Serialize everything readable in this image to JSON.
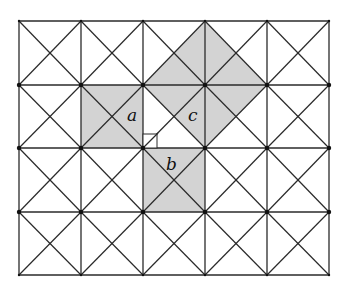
{
  "figure": {
    "grid": {
      "x": [
        19,
        81,
        143,
        205,
        267,
        329
      ],
      "y": [
        21,
        85,
        148,
        212,
        275
      ],
      "line_color": "#2a2a2a",
      "background": "#ffffff"
    },
    "shade_color": "#d3d3d3",
    "shaded_squares": [
      {
        "id": "square-a",
        "points": [
          [
            81,
            85
          ],
          [
            143,
            85
          ],
          [
            143,
            148
          ],
          [
            81,
            148
          ]
        ]
      },
      {
        "id": "square-b",
        "points": [
          [
            143,
            148
          ],
          [
            205,
            148
          ],
          [
            205,
            212
          ],
          [
            143,
            212
          ]
        ]
      },
      {
        "id": "square-c",
        "points": [
          [
            205,
            21
          ],
          [
            267,
            85
          ],
          [
            205,
            148
          ],
          [
            143,
            85
          ]
        ]
      }
    ],
    "right_angle_marker": {
      "x": 143,
      "y": 134,
      "size": 14
    },
    "labels": [
      {
        "id": "label-a",
        "text": "a",
        "x": 132,
        "y": 121
      },
      {
        "id": "label-c",
        "text": "c",
        "x": 193,
        "y": 121
      },
      {
        "id": "label-b",
        "text": "b",
        "x": 172,
        "y": 170
      }
    ]
  }
}
